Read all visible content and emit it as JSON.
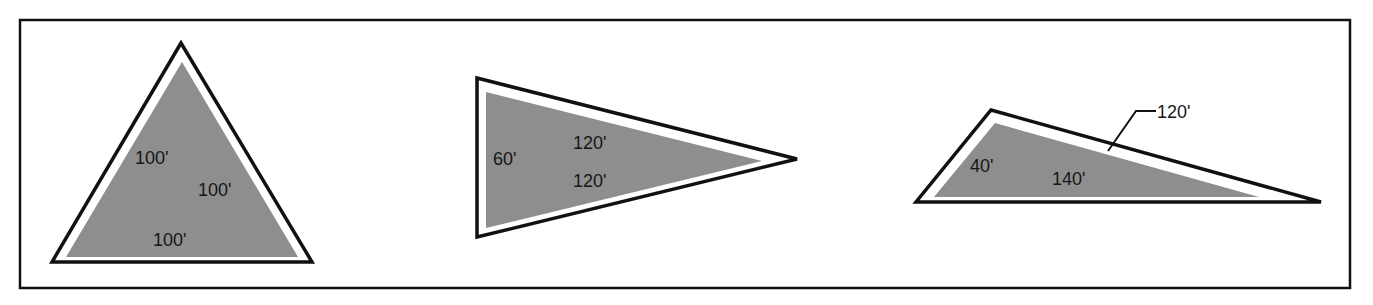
{
  "figure": {
    "colors": {
      "outline": "#111111",
      "fill": "#8e8e8e",
      "background": "#ffffff"
    },
    "triangles": [
      {
        "name": "equilateral",
        "sides": [
          "100'",
          "100'",
          "100'"
        ]
      },
      {
        "name": "isosceles",
        "sides": [
          "60'",
          "120'",
          "120'"
        ]
      },
      {
        "name": "scalene",
        "sides": [
          "40'",
          "140'",
          "120'"
        ],
        "leader_label": "120'"
      }
    ]
  }
}
